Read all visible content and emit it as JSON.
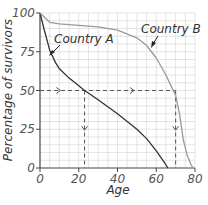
{
  "chart_data": {
    "type": "line",
    "title": "",
    "xlabel": "Age",
    "ylabel": "Percentage of survivors",
    "xlim": [
      0,
      80
    ],
    "ylim": [
      0,
      100
    ],
    "x_ticks": [
      "0",
      "20",
      "40",
      "60",
      "80"
    ],
    "y_ticks": [
      "0",
      "25",
      "50",
      "75",
      "100"
    ],
    "grid": true,
    "series": [
      {
        "name": "Country A",
        "color": "#333333",
        "x": [
          0,
          2,
          5,
          8,
          10,
          15,
          20,
          23,
          30,
          40,
          50,
          55,
          60,
          64,
          66
        ],
        "y": [
          100,
          90,
          76,
          68,
          64,
          58,
          53,
          50,
          44,
          35,
          25,
          19,
          11,
          4,
          0
        ]
      },
      {
        "name": "Country B",
        "color": "#999999",
        "x": [
          0,
          5,
          10,
          20,
          30,
          40,
          50,
          55,
          60,
          65,
          68,
          70,
          72,
          74,
          76,
          78,
          79
        ],
        "y": [
          100,
          94,
          93,
          92,
          91,
          89,
          84,
          79,
          71,
          60,
          52,
          47,
          35,
          18,
          8,
          2,
          0
        ]
      }
    ],
    "annotations": [
      {
        "text": "Country A",
        "points_to_series": "Country A"
      },
      {
        "text": "Country B",
        "points_to_series": "Country B"
      },
      {
        "type": "dashed-guide",
        "y": 50,
        "x_intersections": [
          23,
          70
        ]
      }
    ]
  }
}
